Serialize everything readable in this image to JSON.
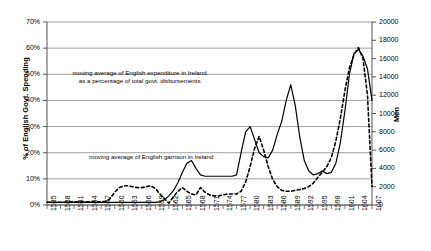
{
  "chart_data": {
    "type": "line",
    "title": "",
    "xlabel": "",
    "ylabel": "% of English Govt. Spending",
    "y2label": "Men",
    "ylim": [
      0,
      70
    ],
    "y2lim": [
      0,
      20000
    ],
    "grid": true,
    "legend_position": "inline-annotations",
    "y_ticks": [
      "0%",
      "10%",
      "20%",
      "30%",
      "40%",
      "50%",
      "60%",
      "70%"
    ],
    "y2_ticks": [
      "0",
      "2000",
      "4000",
      "6000",
      "8000",
      "10000",
      "12000",
      "14000",
      "16000",
      "18000",
      "20000"
    ],
    "x_ticks": [
      "1535",
      "1538",
      "1541",
      "1544",
      "1547",
      "1550",
      "1553",
      "1556",
      "1559",
      "1562",
      "1565",
      "1568",
      "1571",
      "1574",
      "1577",
      "1580",
      "1583",
      "1586",
      "1589",
      "1592",
      "1595",
      "1598",
      "1601",
      "1604",
      "1607"
    ],
    "annotations": [
      {
        "name": "expenditure-annotation",
        "text": "moving average of English expenditure in Ireland\nas a percentage of total govt. disbursements",
        "x_pct": 28.5,
        "y_pct": 25.5
      },
      {
        "name": "garrison-annotation",
        "text": "moving average of English garrison in Ireland",
        "x_pct": 13.0,
        "y_pct": 71.5
      }
    ],
    "series": [
      {
        "name": "moving average of English expenditure in Ireland as a percentage of total govt. disbursements",
        "axis": "left",
        "style": "solid",
        "color": "#000000",
        "unit": "%",
        "x": [
          1535,
          1536,
          1537,
          1538,
          1539,
          1540,
          1541,
          1542,
          1543,
          1544,
          1545,
          1546,
          1547,
          1548,
          1549,
          1550,
          1551,
          1552,
          1553,
          1554,
          1555,
          1556,
          1557,
          1558,
          1559,
          1560,
          1561,
          1562,
          1563,
          1564,
          1565,
          1566,
          1567,
          1568,
          1569,
          1570,
          1571,
          1572,
          1573,
          1574,
          1575,
          1576,
          1577,
          1578,
          1579,
          1580,
          1581,
          1582,
          1583,
          1584,
          1585,
          1586,
          1587,
          1588,
          1589,
          1590,
          1591,
          1592,
          1593,
          1594,
          1595,
          1596,
          1597,
          1598,
          1599,
          1600,
          1601,
          1602,
          1603,
          1604,
          1605,
          1606,
          1607
        ],
        "values": [
          1.0,
          1.0,
          1.0,
          1.0,
          1.0,
          1.0,
          1.0,
          1.0,
          1.0,
          1.0,
          1.0,
          1.0,
          1.0,
          1.0,
          1.0,
          1.0,
          1.0,
          1.0,
          1.0,
          1.0,
          1.0,
          1.0,
          1.0,
          1.0,
          1.0,
          1.2,
          2.0,
          3.5,
          5.5,
          8.5,
          12.5,
          16.0,
          17.0,
          14.0,
          11.5,
          11.0,
          11.0,
          11.0,
          11.0,
          11.0,
          11.0,
          11.0,
          11.5,
          20.0,
          28.0,
          30.0,
          25.0,
          20.0,
          18.5,
          18.0,
          21.0,
          27.0,
          32.0,
          40.0,
          46.0,
          38.0,
          26.0,
          17.0,
          13.0,
          11.5,
          12.0,
          13.0,
          12.0,
          12.5,
          16.0,
          24.0,
          36.0,
          50.0,
          58.0,
          59.5,
          57.0,
          52.0,
          40.0
        ]
      },
      {
        "name": "moving average of English garrison in Ireland",
        "axis": "right",
        "style": "dashed",
        "color": "#000000",
        "unit": "men",
        "x": [
          1535,
          1536,
          1537,
          1538,
          1539,
          1540,
          1541,
          1542,
          1543,
          1544,
          1545,
          1546,
          1547,
          1548,
          1549,
          1550,
          1551,
          1552,
          1553,
          1554,
          1555,
          1556,
          1557,
          1558,
          1559,
          1560,
          1561,
          1562,
          1563,
          1564,
          1565,
          1566,
          1567,
          1568,
          1569,
          1570,
          1571,
          1572,
          1573,
          1574,
          1575,
          1576,
          1577,
          1578,
          1579,
          1580,
          1581,
          1582,
          1583,
          1584,
          1585,
          1586,
          1587,
          1588,
          1589,
          1590,
          1591,
          1592,
          1593,
          1594,
          1595,
          1596,
          1597,
          1598,
          1599,
          1600,
          1601,
          1602,
          1603,
          1604,
          1605,
          1606,
          1607
        ],
        "values": [
          300,
          300,
          300,
          300,
          300,
          350,
          350,
          350,
          350,
          350,
          350,
          350,
          350,
          400,
          700,
          1400,
          1900,
          2100,
          2100,
          2000,
          1900,
          1900,
          2000,
          2100,
          1800,
          1200,
          700,
          200,
          900,
          1500,
          1900,
          1500,
          1200,
          1100,
          1900,
          1400,
          1100,
          1000,
          1000,
          1100,
          1200,
          1200,
          1200,
          1500,
          2500,
          4200,
          6200,
          7500,
          6000,
          4200,
          2800,
          2000,
          1600,
          1500,
          1500,
          1600,
          1700,
          1800,
          2000,
          2400,
          3000,
          3600,
          4200,
          5200,
          7000,
          9500,
          12500,
          15000,
          16400,
          17200,
          16000,
          12000,
          2000
        ]
      }
    ]
  },
  "axes": {
    "y_left_title": "% of English Govt. Spending",
    "y_right_title": "Men"
  }
}
